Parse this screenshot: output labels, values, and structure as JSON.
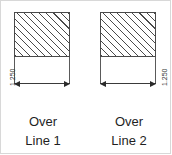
{
  "drawing": {
    "title": "Over Line dimension comparison",
    "background_color": "#ffffff",
    "line_color": "#4a4a4a",
    "text_color": "#1f1f1f",
    "hatch_angle_deg": 45
  },
  "figures": [
    {
      "id": "figure-1",
      "dimension_value": "1.250",
      "caption_line_1": "Over",
      "caption_line_2": "Line 1",
      "part_shape": "rectangle",
      "part_fill": "diagonal-hatch"
    },
    {
      "id": "figure-2",
      "dimension_value": "1.250",
      "caption_line_1": "Over",
      "caption_line_2": "Line 2",
      "part_shape": "rectangle",
      "part_fill": "diagonal-hatch"
    }
  ]
}
